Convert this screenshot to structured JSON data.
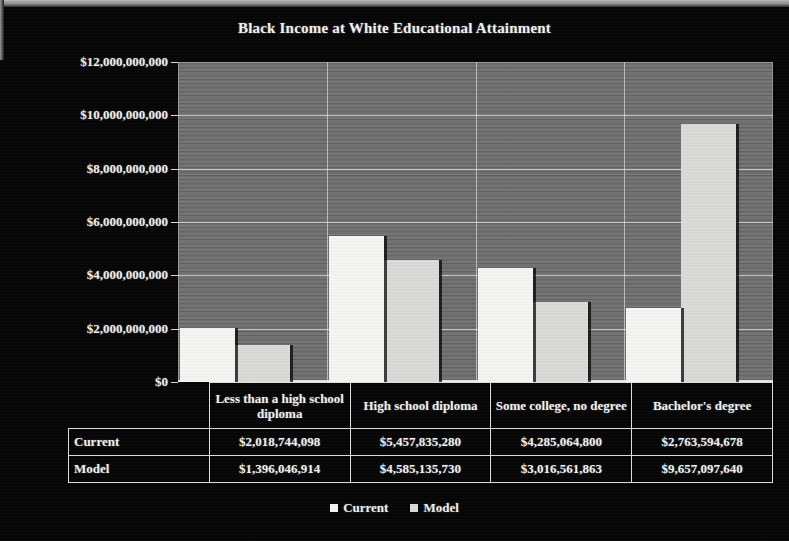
{
  "chart_data": {
    "type": "bar",
    "title": "Black  Income at White Educational Attainment",
    "xlabel": "",
    "ylabel": "",
    "ylim": [
      0,
      12000000000
    ],
    "grid": true,
    "legend_position": "bottom",
    "categories": [
      "Less than a high school diploma",
      "High school diploma",
      "Some college, no degree",
      "Bachelor's degree"
    ],
    "series": [
      {
        "name": "Current",
        "color": "#f6f6f4",
        "values": [
          2018744098,
          5457835280,
          4285064800,
          2763594678
        ],
        "labels": [
          "$2,018,744,098",
          "$5,457,835,280",
          "$4,285,064,800",
          "$2,763,594,678"
        ]
      },
      {
        "name": "Model",
        "color": "#dcdcda",
        "values": [
          1396046914,
          4585135730,
          3016561863,
          9657097640
        ],
        "labels": [
          "$1,396,046,914",
          "$4,585,135,730",
          "$3,016,561,863",
          "$9,657,097,640"
        ]
      }
    ],
    "ytick_values": [
      0,
      2000000000,
      4000000000,
      6000000000,
      8000000000,
      10000000000,
      12000000000
    ],
    "ytick_labels": [
      "$0",
      "$2,000,000,000",
      "$4,000,000,000",
      "$6,000,000,000",
      "$8,000,000,000",
      "$10,000,000,000",
      "$12,000,000,000"
    ]
  },
  "table": {
    "row_labels": [
      "Current",
      "Model"
    ],
    "column_headers": [
      "Less than a high school diploma",
      "High school diploma",
      "Some college, no degree",
      "Bachelor's degree"
    ],
    "rows": [
      [
        "$2,018,744,098",
        "$5,457,835,280",
        "$4,285,064,800",
        "$2,763,594,678"
      ],
      [
        "$1,396,046,914",
        "$4,585,135,730",
        "$3,016,561,863",
        "$9,657,097,640"
      ]
    ]
  },
  "legend": {
    "items": [
      {
        "label": "Current",
        "color": "#f6f6f4",
        "marker": "square-marker"
      },
      {
        "label": "Model",
        "color": "#dcdcda",
        "marker": "square-marker"
      }
    ]
  },
  "colors": {
    "background": "#060606",
    "plot_background": "#6d6d6d",
    "text": "#f4f4f4",
    "gridline": "#ebebeb"
  }
}
